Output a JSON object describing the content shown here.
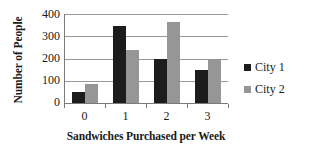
{
  "chart_data": {
    "type": "bar",
    "title": "",
    "xlabel": "Sandwiches Purchased per Week",
    "ylabel": "Number of People",
    "categories": [
      "0",
      "1",
      "2",
      "3"
    ],
    "series": [
      {
        "name": "City 1",
        "color": "#1c1c1c",
        "values": [
          50,
          348,
          200,
          150
        ]
      },
      {
        "name": "City 2",
        "color": "#969696",
        "values": [
          85,
          238,
          365,
          200
        ]
      }
    ],
    "ylim": [
      0,
      400
    ],
    "yticks": [
      0,
      100,
      200,
      300,
      400
    ],
    "ytick_labels": [
      "0",
      "100",
      "200",
      "300",
      "400"
    ],
    "grid": true,
    "grid_axis": "y",
    "legend_position": "right",
    "legend": [
      {
        "label": "City 1",
        "color": "#1c1c1c"
      },
      {
        "label": "City 2",
        "color": "#969696"
      }
    ]
  }
}
